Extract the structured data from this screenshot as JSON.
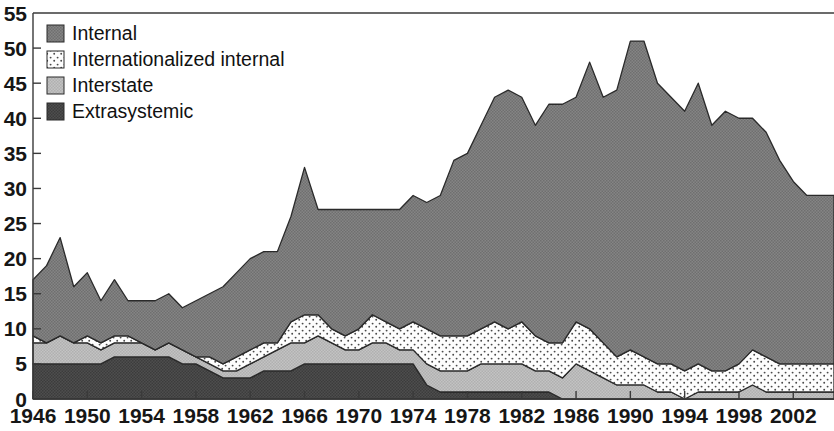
{
  "chart": {
    "type": "area",
    "title": "",
    "xlabel": "",
    "ylabel": "",
    "stacked": true,
    "legend_position": "top-left"
  },
  "axes": {
    "y_ticks": [
      "0",
      "5",
      "10",
      "15",
      "20",
      "25",
      "30",
      "35",
      "40",
      "45",
      "50",
      "55"
    ],
    "x_ticks": [
      "1946",
      "1950",
      "1954",
      "1958",
      "1962",
      "1966",
      "1970",
      "1974",
      "1978",
      "1982",
      "1986",
      "1990",
      "1994",
      "1998",
      "2002"
    ]
  },
  "legend": {
    "items": [
      {
        "label": "Internal",
        "color": "#7d7d7d",
        "pattern": "solid-gray"
      },
      {
        "label": "Internationalized internal",
        "color": "#fbfbfb",
        "pattern": "fine-dots"
      },
      {
        "label": "Interstate",
        "color": "#b9b9b9",
        "pattern": "light-gray"
      },
      {
        "label": "Extrasystemic",
        "color": "#474747",
        "pattern": "dark-gray"
      }
    ]
  },
  "chart_data": {
    "type": "area",
    "title": "",
    "subtitle": "",
    "xlabel": "",
    "ylabel": "",
    "stacked": true,
    "grid": false,
    "legend_position": "top-left",
    "xlim": [
      1946,
      2005
    ],
    "ylim": [
      0,
      55
    ],
    "ytick_step": 5,
    "xtick_step": 4,
    "x": [
      1946,
      1947,
      1948,
      1949,
      1950,
      1951,
      1952,
      1953,
      1954,
      1955,
      1956,
      1957,
      1958,
      1959,
      1960,
      1961,
      1962,
      1963,
      1964,
      1965,
      1966,
      1967,
      1968,
      1969,
      1970,
      1971,
      1972,
      1973,
      1974,
      1975,
      1976,
      1977,
      1978,
      1979,
      1980,
      1981,
      1982,
      1983,
      1984,
      1985,
      1986,
      1987,
      1988,
      1989,
      1990,
      1991,
      1992,
      1993,
      1994,
      1995,
      1996,
      1997,
      1998,
      1999,
      2000,
      2001,
      2002,
      2003,
      2004,
      2005
    ],
    "stack_order_bottom_to_top": [
      "Extrasystemic",
      "Interstate",
      "Internationalized internal",
      "Internal"
    ],
    "series": [
      {
        "name": "Extrasystemic",
        "color": "#474747",
        "values": [
          5,
          5,
          5,
          5,
          5,
          5,
          6,
          6,
          6,
          6,
          6,
          5,
          5,
          4,
          3,
          3,
          3,
          4,
          4,
          4,
          5,
          5,
          5,
          5,
          5,
          5,
          5,
          5,
          5,
          2,
          1,
          1,
          1,
          1,
          1,
          1,
          1,
          1,
          1,
          0,
          0,
          0,
          0,
          0,
          0,
          0,
          0,
          0,
          0,
          0,
          0,
          0,
          0,
          0,
          0,
          0,
          0,
          0,
          0,
          0
        ]
      },
      {
        "name": "Interstate",
        "color": "#b9b9b9",
        "values": [
          3,
          3,
          4,
          3,
          3,
          2,
          2,
          2,
          2,
          1,
          2,
          2,
          1,
          1,
          1,
          1,
          2,
          2,
          3,
          4,
          3,
          4,
          3,
          2,
          2,
          3,
          3,
          2,
          2,
          3,
          3,
          3,
          3,
          4,
          4,
          4,
          4,
          3,
          3,
          3,
          5,
          4,
          3,
          2,
          2,
          2,
          1,
          1,
          0,
          1,
          1,
          1,
          1,
          2,
          1,
          1,
          1,
          1,
          1,
          1
        ]
      },
      {
        "name": "Internationalized internal",
        "color": "#fbfbfb",
        "values": [
          1,
          0,
          0,
          0,
          1,
          1,
          1,
          1,
          0,
          0,
          0,
          0,
          0,
          1,
          1,
          2,
          2,
          2,
          1,
          3,
          4,
          3,
          2,
          2,
          3,
          4,
          3,
          3,
          4,
          5,
          5,
          5,
          5,
          5,
          6,
          5,
          6,
          5,
          4,
          5,
          6,
          6,
          5,
          4,
          5,
          4,
          4,
          4,
          4,
          4,
          3,
          3,
          4,
          5,
          5,
          4,
          4,
          4,
          4,
          4
        ]
      },
      {
        "name": "Internal",
        "color": "#7d7d7d",
        "values": [
          8,
          11,
          14,
          8,
          9,
          6,
          8,
          5,
          6,
          7,
          7,
          6,
          8,
          9,
          11,
          12,
          13,
          13,
          13,
          15,
          21,
          15,
          17,
          18,
          17,
          15,
          16,
          17,
          18,
          18,
          20,
          25,
          26,
          29,
          32,
          34,
          32,
          30,
          34,
          34,
          32,
          38,
          35,
          38,
          44,
          45,
          40,
          38,
          37,
          40,
          35,
          37,
          35,
          33,
          32,
          29,
          26,
          24,
          24,
          24
        ]
      }
    ],
    "totals": [
      17,
      19,
      23,
      16,
      18,
      14,
      17,
      14,
      14,
      14,
      15,
      13,
      14,
      15,
      16,
      18,
      20,
      21,
      21,
      26,
      33,
      27,
      27,
      27,
      27,
      27,
      27,
      27,
      29,
      28,
      29,
      34,
      35,
      39,
      43,
      44,
      43,
      39,
      42,
      42,
      43,
      48,
      43,
      44,
      51,
      51,
      45,
      43,
      41,
      45,
      39,
      41,
      40,
      40,
      38,
      34,
      31,
      29,
      29,
      29
    ]
  }
}
